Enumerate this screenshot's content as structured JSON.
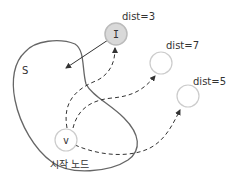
{
  "diagram": {
    "set_label": "S",
    "start_label": "시작 노드",
    "nodes": {
      "I": {
        "label": "I",
        "dist": "dist=3"
      },
      "v": {
        "label": "v"
      },
      "n7": {
        "dist": "dist=7"
      },
      "n5": {
        "dist": "dist=5"
      }
    },
    "colors": {
      "outline": "#666666",
      "node_stroke": "#cccccc",
      "node_fill_I": "#d9d9d9",
      "arrow": "#333333"
    }
  }
}
